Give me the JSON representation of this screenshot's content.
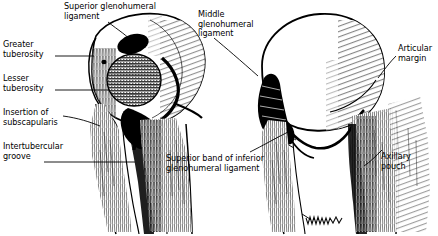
{
  "figure": {
    "background_color": "#ffffff",
    "ink_color": "#000000"
  },
  "labels": {
    "superior_glenohumeral_ligament": "Superior glenohumeral\nligament",
    "middle_glenohumeral_ligament": "Middle\nglenohumeral\nligament",
    "greater_tuberosity": "Greater\ntuberosity",
    "lesser_tuberosity": "Lesser\ntuberosity",
    "insertion_of_subscapularis": "Insertion of\nsubscapularis",
    "intertubercular_groove": "Intertubercular\ngroove",
    "superior_band_of_inferior_glenohumeral_ligament": "Superior band of inferior\nglenohumeral ligament",
    "articular_margin": "Articular\nmargin",
    "axillary_pouch": "Axillary\npouch"
  },
  "structures": {
    "left_view": "anterior humerus with shaded glenohumeral ligament footprint",
    "right_view": "posterior humerus with articular margin and axillary pouch",
    "artist_signature": "signature squiggle at base of right shaft"
  }
}
